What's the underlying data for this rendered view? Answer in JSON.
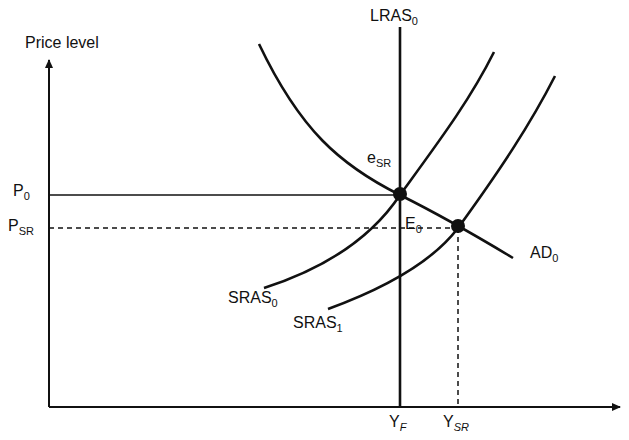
{
  "diagram": {
    "type": "AD-AS macroeconomic diagram",
    "axes": {
      "y_label": "Price level",
      "x_label": ""
    },
    "curves": [
      {
        "id": "LRAS",
        "label": "LRAS",
        "subscript": "0",
        "kind": "vertical line"
      },
      {
        "id": "AD",
        "label": "AD",
        "subscript": "0",
        "kind": "downward sloping curve"
      },
      {
        "id": "SRAS0",
        "label": "SRAS",
        "subscript": "0",
        "kind": "upward sloping curve"
      },
      {
        "id": "SRAS1",
        "label": "SRAS",
        "subscript": "1",
        "kind": "upward sloping curve (shifted right)"
      }
    ],
    "points": [
      {
        "id": "eSR",
        "label": "e",
        "subscript": "SR",
        "note": "intersection of AD0, SRAS0 and LRAS0"
      },
      {
        "id": "E0",
        "label": "E",
        "subscript": "0",
        "note": "intersection of AD0 and SRAS1"
      }
    ],
    "y_ticks": [
      {
        "label": "P",
        "subscript": "0",
        "line": "solid"
      },
      {
        "label": "P",
        "subscript": "SR",
        "line": "dashed"
      }
    ],
    "x_ticks": [
      {
        "label": "Y",
        "subscript": "F"
      },
      {
        "label": "Y",
        "subscript": "SR"
      }
    ]
  },
  "labels": {
    "price_level": "Price level",
    "lras_main": "LRAS",
    "lras_sub": "0",
    "esr_main": "e",
    "esr_sub": "SR",
    "e0_main": "E",
    "e0_sub": "0",
    "ad_main": "AD",
    "ad_sub": "0",
    "sras0_main": "SRAS",
    "sras0_sub": "0",
    "sras1_main": "SRAS",
    "sras1_sub": "1",
    "p0_main": "P",
    "p0_sub": "0",
    "psr_main": "P",
    "psr_sub": "SR",
    "yf_main": "Y",
    "yf_sub": "F",
    "ysr_main": "Y",
    "ysr_sub": "SR"
  },
  "colors": {
    "ink": "#111111",
    "background": "#ffffff"
  }
}
